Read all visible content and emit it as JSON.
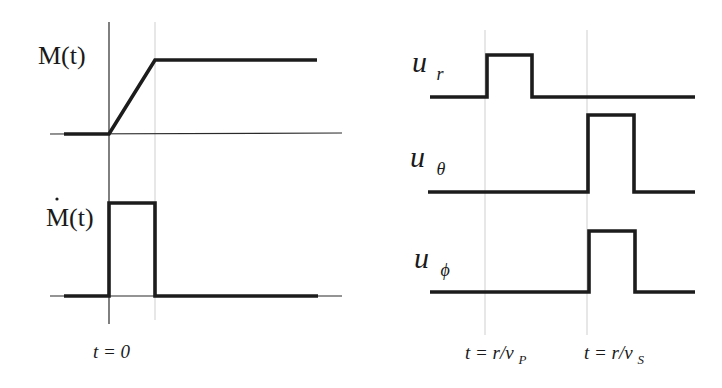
{
  "figure": {
    "left_panel": {
      "moment": {
        "label": "M(t)",
        "shape": "ramp",
        "description": "Ramp from 0 at t=0 to plateau at t=T"
      },
      "moment_rate": {
        "label": "Ṁ(t)",
        "label_base": "M(t)",
        "shape": "boxcar",
        "description": "Boxcar pulse from t=0 to t=T"
      },
      "time_label": "t = 0"
    },
    "right_panel": {
      "components": [
        {
          "symbol": "u",
          "subscript": "r",
          "label": "u_r",
          "pulse_arrival": "P"
        },
        {
          "symbol": "u",
          "subscript": "θ",
          "label": "u_θ",
          "pulse_arrival": "S"
        },
        {
          "symbol": "u",
          "subscript": "ϕ",
          "label": "u_ϕ",
          "pulse_arrival": "S"
        }
      ],
      "time_labels": [
        {
          "text": "t = r/v",
          "subscript": "P",
          "full": "t = r/v_P"
        },
        {
          "text": "t = r/v",
          "subscript": "S",
          "full": "t = r/v_S"
        }
      ]
    },
    "colors": {
      "line": "#1c1c1c",
      "axis": "#2a2a2a",
      "guide": "#cfcfcf",
      "background": "#ffffff"
    }
  }
}
